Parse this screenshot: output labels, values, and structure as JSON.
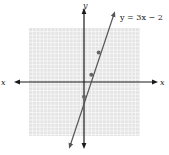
{
  "chart_data": {
    "type": "line",
    "title": "",
    "equation_label": "y = 3x − 2",
    "xlabel": "x",
    "ylabel": "y",
    "xlim": [
      -7.5,
      7.5
    ],
    "ylim": [
      -7.5,
      7.5
    ],
    "grid": true,
    "series": [
      {
        "name": "y = 3x − 2",
        "slope": 3,
        "intercept": -2,
        "x": [
          -1.9,
          4.1
        ],
        "y": [
          -7.7,
          10.3
        ]
      }
    ],
    "points": [
      {
        "x": 0,
        "y": -2
      },
      {
        "x": 1,
        "y": 1
      },
      {
        "x": 2,
        "y": 4
      }
    ],
    "colors": {
      "grid_bg": "#e4e4e4",
      "grid_line": "#f7f7f7",
      "axis": "#1a1a1a",
      "line": "#555555",
      "point": "#666666"
    }
  },
  "labels": {
    "x_left": "x",
    "x_right": "x",
    "y_top": "y",
    "equation": "y = 3x − 2"
  }
}
